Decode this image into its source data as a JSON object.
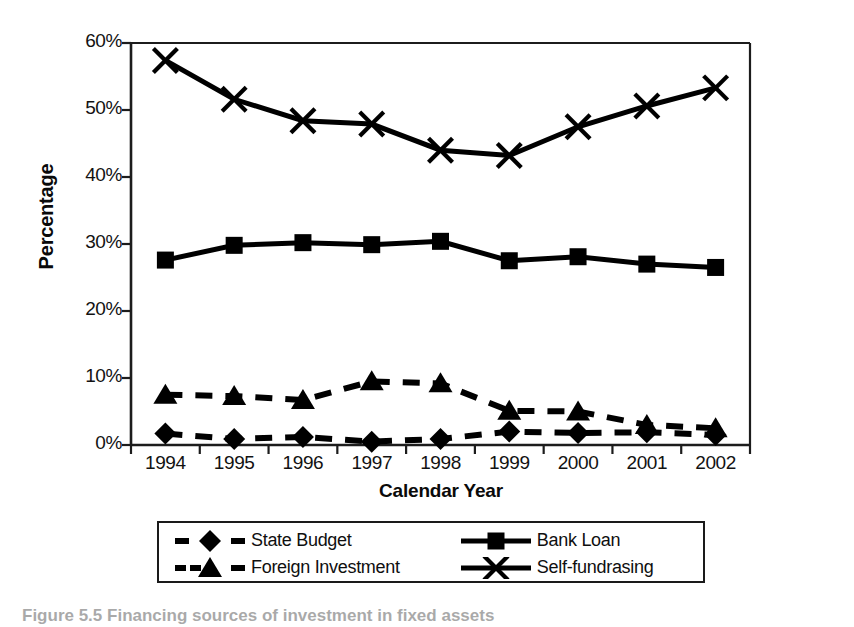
{
  "figure": {
    "caption": "Figure 5.5  Financing sources of investment in fixed assets"
  },
  "chart_data": {
    "type": "line",
    "title": "",
    "xlabel": "Calendar Year",
    "ylabel": "Percentage",
    "categories": [
      "1994",
      "1995",
      "1996",
      "1997",
      "1998",
      "1999",
      "2000",
      "2001",
      "2002"
    ],
    "ylim": [
      0,
      60
    ],
    "y_ticks": [
      0,
      10,
      20,
      30,
      40,
      50,
      60
    ],
    "y_tick_labels": [
      "0%",
      "10%",
      "20%",
      "30%",
      "40%",
      "50%",
      "60%"
    ],
    "grid": false,
    "legend_position": "below",
    "series": [
      {
        "name": "State Budget",
        "marker": "diamond",
        "line_style": "dashed",
        "color": "#000000",
        "values": [
          1.7,
          0.9,
          1.2,
          0.5,
          0.9,
          2.0,
          1.8,
          1.9,
          1.5
        ]
      },
      {
        "name": "Bank Loan",
        "marker": "square",
        "line_style": "solid",
        "color": "#000000",
        "values": [
          27.6,
          29.8,
          30.2,
          29.9,
          30.4,
          27.5,
          28.1,
          27.0,
          26.5
        ]
      },
      {
        "name": "Foreign Investment",
        "marker": "triangle",
        "line_style": "dashed",
        "color": "#000000",
        "values": [
          7.5,
          7.3,
          6.7,
          9.5,
          9.2,
          5.1,
          5.0,
          3.0,
          2.5
        ]
      },
      {
        "name": "Self-fundrasing",
        "marker": "x",
        "line_style": "solid",
        "color": "#000000",
        "values": [
          57.4,
          51.6,
          48.4,
          47.9,
          44.0,
          43.2,
          47.5,
          50.6,
          53.3
        ]
      }
    ]
  },
  "legend": {
    "entries": [
      {
        "label": "State Budget",
        "marker": "diamond",
        "line_style": "dashed"
      },
      {
        "label": "Bank Loan",
        "marker": "square",
        "line_style": "solid"
      },
      {
        "label": "Foreign Investment",
        "marker": "triangle",
        "line_style": "dashed"
      },
      {
        "label": "Self-fundrasing",
        "marker": "x",
        "line_style": "solid"
      }
    ]
  }
}
